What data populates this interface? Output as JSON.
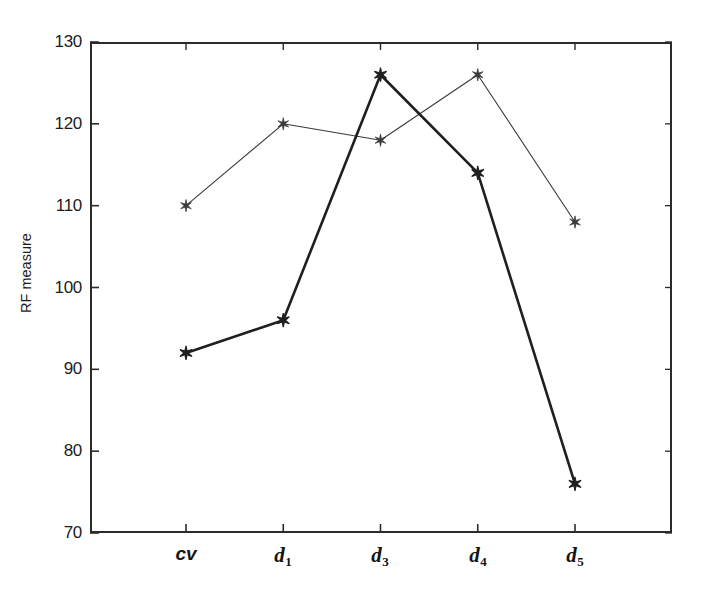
{
  "chart_data": {
    "type": "line",
    "title": "",
    "xlabel": "",
    "ylabel": "RF measure",
    "categories": [
      "cv",
      "d1",
      "d3",
      "d4",
      "d5"
    ],
    "category_labels_display": [
      "cv",
      "d₁",
      "d₃",
      "d₄",
      "d₅"
    ],
    "ylim": [
      70,
      130
    ],
    "yticks": [
      70,
      80,
      90,
      100,
      110,
      120,
      130
    ],
    "ytick_labels": [
      "70",
      "80",
      "90",
      "100",
      "110",
      "120",
      "130"
    ],
    "grid": false,
    "legend": "none",
    "marker": "six-pointed-star",
    "series": [
      {
        "name": "thin-line-series",
        "values": [
          110,
          120,
          118,
          126,
          108
        ],
        "line_width": 1.1,
        "color": "#3a3a3a"
      },
      {
        "name": "thick-line-series",
        "values": [
          92,
          96,
          126,
          114,
          76
        ],
        "line_width": 2.6,
        "color": "#1f1f1f"
      }
    ]
  },
  "axes": {
    "y_title": "RF measure",
    "y_tick_labels": [
      "130",
      "120",
      "110",
      "100",
      "90",
      "80",
      "70"
    ],
    "x_tick_parts": [
      {
        "base": "cv",
        "sub": ""
      },
      {
        "base": "d",
        "sub": "1"
      },
      {
        "base": "d",
        "sub": "3"
      },
      {
        "base": "d",
        "sub": "4"
      },
      {
        "base": "d",
        "sub": "5"
      }
    ]
  },
  "style": {
    "background": "#ffffff",
    "frame_color": "#2b2b2b",
    "text_color": "#1c1c1c"
  }
}
